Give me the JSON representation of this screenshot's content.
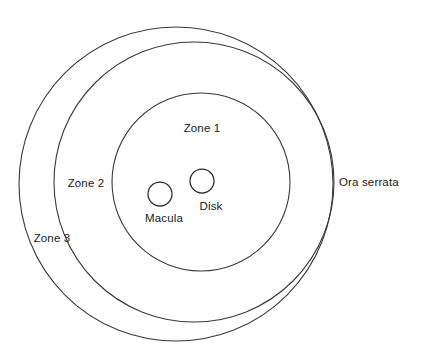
{
  "diagram": {
    "type": "concentric-ring-diagram",
    "canvas": {
      "width": 423,
      "height": 364,
      "background": "#ffffff"
    },
    "stroke_color": "#3a3a3a",
    "text_color": "#1a1a1a",
    "labels": {
      "zone1": "Zone 1",
      "zone2": "Zone 2",
      "zone3": "Zone 3",
      "ora_serrata": "Ora serrata",
      "disk": "Disk",
      "macula": "Macula"
    },
    "rings": [
      {
        "name": "zone-3-boundary",
        "label": "Zone 3",
        "cx": 176,
        "cy": 184,
        "r": 157
      },
      {
        "name": "zone-2-boundary",
        "label": "Zone 2",
        "cx": 194,
        "cy": 182,
        "r": 140
      },
      {
        "name": "zone-1-boundary",
        "label": "Zone 1",
        "cx": 201,
        "cy": 182,
        "r": 89
      }
    ],
    "features": [
      {
        "name": "optic-disk",
        "label": "Disk",
        "cx": 202,
        "cy": 181,
        "r": 12
      },
      {
        "name": "macula",
        "label": "Macula",
        "cx": 160,
        "cy": 194,
        "r": 12
      }
    ],
    "label_positions": {
      "zone1": {
        "x": 202,
        "y": 128
      },
      "zone2": {
        "x": 86,
        "y": 183
      },
      "zone3": {
        "x": 52,
        "y": 238
      },
      "ora_serrata": {
        "x": 339,
        "y": 182
      },
      "disk": {
        "x": 211,
        "y": 206
      },
      "macula": {
        "x": 164,
        "y": 218
      }
    }
  }
}
